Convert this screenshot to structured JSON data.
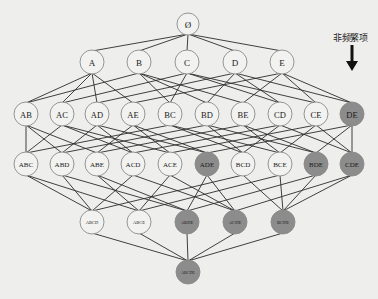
{
  "diagram": {
    "type": "itemset-lattice",
    "colors": {
      "frequent_fill": "#f2f2f0",
      "infrequent_fill": "#8c8c8c",
      "edge": "#2b2b2b",
      "background": "#eeeeec"
    },
    "annotation": {
      "label": "非频繁项",
      "points_to": "DE"
    },
    "levels": [
      {
        "y": 24,
        "r": 11,
        "font": 9,
        "nodes": [
          {
            "id": "Ø",
            "x": 188,
            "infrequent": false
          }
        ]
      },
      {
        "y": 62,
        "r": 12,
        "font": 9,
        "nodes": [
          {
            "id": "A",
            "x": 92,
            "infrequent": false
          },
          {
            "id": "B",
            "x": 139,
            "infrequent": false
          },
          {
            "id": "C",
            "x": 187,
            "infrequent": false
          },
          {
            "id": "D",
            "x": 235,
            "infrequent": false
          },
          {
            "id": "E",
            "x": 282,
            "infrequent": false
          }
        ]
      },
      {
        "y": 114,
        "r": 12,
        "font": 8.5,
        "nodes": [
          {
            "id": "AB",
            "x": 26,
            "infrequent": false
          },
          {
            "id": "AC",
            "x": 62,
            "infrequent": false
          },
          {
            "id": "AD",
            "x": 97,
            "infrequent": false
          },
          {
            "id": "AE",
            "x": 133,
            "infrequent": false
          },
          {
            "id": "BC",
            "x": 170,
            "infrequent": false
          },
          {
            "id": "BD",
            "x": 207,
            "infrequent": false
          },
          {
            "id": "BE",
            "x": 243,
            "infrequent": false
          },
          {
            "id": "CD",
            "x": 280,
            "infrequent": false
          },
          {
            "id": "CE",
            "x": 316,
            "infrequent": false
          },
          {
            "id": "DE",
            "x": 352,
            "infrequent": true
          }
        ]
      },
      {
        "y": 164,
        "r": 12,
        "font": 7,
        "nodes": [
          {
            "id": "ABC",
            "x": 26,
            "infrequent": false
          },
          {
            "id": "ABD",
            "x": 62,
            "infrequent": false
          },
          {
            "id": "ABE",
            "x": 97,
            "infrequent": false
          },
          {
            "id": "ACD",
            "x": 133,
            "infrequent": false
          },
          {
            "id": "ACE",
            "x": 170,
            "infrequent": false
          },
          {
            "id": "ADE",
            "x": 207,
            "infrequent": true
          },
          {
            "id": "BCD",
            "x": 243,
            "infrequent": false
          },
          {
            "id": "BCE",
            "x": 280,
            "infrequent": false
          },
          {
            "id": "BDE",
            "x": 316,
            "infrequent": true
          },
          {
            "id": "CDE",
            "x": 352,
            "infrequent": true
          }
        ]
      },
      {
        "y": 222,
        "r": 12,
        "font": 4.5,
        "nodes": [
          {
            "id": "ABCD",
            "x": 92,
            "infrequent": false
          },
          {
            "id": "ABCE",
            "x": 139,
            "infrequent": false
          },
          {
            "id": "ABDE",
            "x": 187,
            "infrequent": true
          },
          {
            "id": "ACDE",
            "x": 235,
            "infrequent": true
          },
          {
            "id": "BCDE",
            "x": 283,
            "infrequent": true
          }
        ]
      },
      {
        "y": 272,
        "r": 12,
        "font": 4,
        "nodes": [
          {
            "id": "ABCDE",
            "x": 188,
            "infrequent": true
          }
        ]
      }
    ]
  }
}
